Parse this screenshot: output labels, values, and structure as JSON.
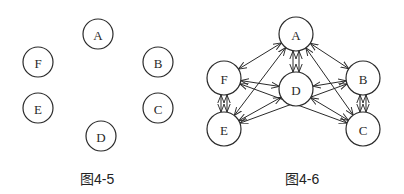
{
  "figures": [
    {
      "id": "fig-4-5",
      "caption": "图4-5",
      "radius": 15,
      "nodes": [
        {
          "label": "A",
          "x": 98,
          "y": 34
        },
        {
          "label": "B",
          "x": 158,
          "y": 62
        },
        {
          "label": "C",
          "x": 158,
          "y": 108
        },
        {
          "label": "D",
          "x": 101,
          "y": 136
        },
        {
          "label": "E",
          "x": 38,
          "y": 108
        },
        {
          "label": "F",
          "x": 38,
          "y": 62
        }
      ],
      "edges": []
    },
    {
      "id": "fig-4-6",
      "caption": "图4-6",
      "radius": 17,
      "nodes": [
        {
          "label": "A",
          "x": 296,
          "y": 34
        },
        {
          "label": "B",
          "x": 363,
          "y": 78
        },
        {
          "label": "C",
          "x": 363,
          "y": 129
        },
        {
          "label": "D",
          "x": 296,
          "y": 89
        },
        {
          "label": "E",
          "x": 224,
          "y": 129
        },
        {
          "label": "F",
          "x": 224,
          "y": 78
        }
      ],
      "edges": [
        {
          "from": "A",
          "to": "F",
          "bidirectional": true
        },
        {
          "from": "A",
          "to": "B",
          "bidirectional": true
        },
        {
          "from": "A",
          "to": "D",
          "bidirectional": true,
          "double": true
        },
        {
          "from": "A",
          "to": "E",
          "bidirectional": true
        },
        {
          "from": "A",
          "to": "C",
          "bidirectional": true
        },
        {
          "from": "F",
          "to": "D",
          "bidirectional": true
        },
        {
          "from": "F",
          "to": "E",
          "bidirectional": true,
          "double": true
        },
        {
          "from": "F",
          "to": "C",
          "bidirectional": true
        },
        {
          "from": "D",
          "to": "B",
          "bidirectional": true
        },
        {
          "from": "D",
          "to": "E",
          "bidirectional": true
        },
        {
          "from": "D",
          "to": "C",
          "bidirectional": true
        },
        {
          "from": "B",
          "to": "E",
          "bidirectional": true
        },
        {
          "from": "B",
          "to": "C",
          "bidirectional": true,
          "double": true
        }
      ]
    }
  ],
  "colors": {
    "stroke": "#2a2a2a",
    "background": "#ffffff"
  }
}
